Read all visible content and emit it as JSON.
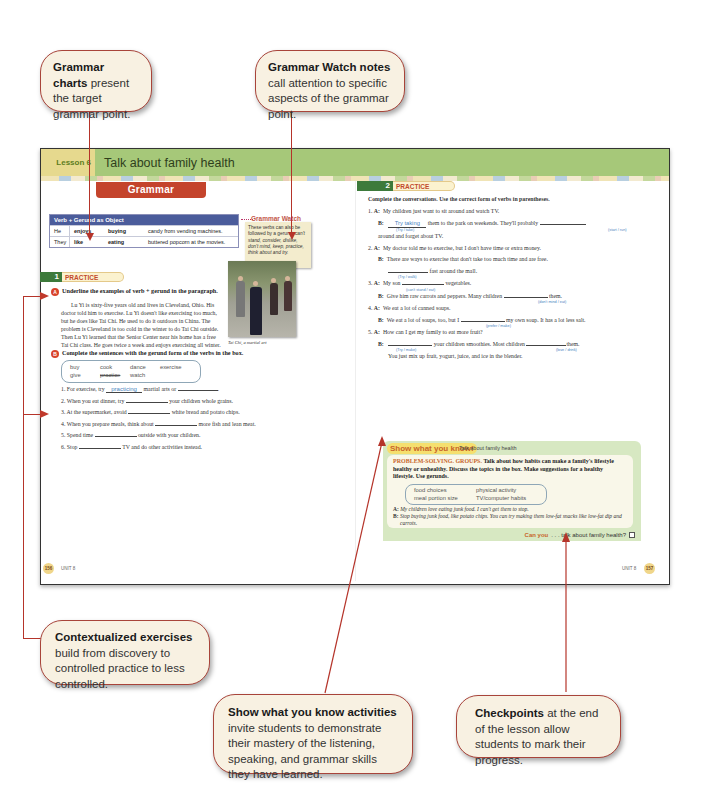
{
  "callouts": {
    "grammar_charts": {
      "bold": "Grammar charts",
      "text": " present the target grammar point."
    },
    "grammar_watch": {
      "bold": "Grammar Watch notes",
      "text": " call attention to specific aspects of the grammar point."
    },
    "contextualized": {
      "bold": "Contextualized exercises",
      "text": " build from discovery to controlled practice to less controlled."
    },
    "show_what": {
      "bold": "Show what you know activities",
      "text": " invite students to demonstrate their mastery of the listening, speaking, and grammar skills they have learned."
    },
    "checkpoints": {
      "bold": "Checkpoints",
      "text": " at the end of the lesson allow students to mark their progress."
    }
  },
  "lesson": {
    "tab": "Lesson 6",
    "title": "Talk about family health"
  },
  "grammar": {
    "banner": "Grammar",
    "table": {
      "header": "Verb + Gerund as Object",
      "rows": [
        {
          "subject": "He",
          "verb": "enjoys",
          "gerund": "buying",
          "object": "candy from vending machines."
        },
        {
          "subject": "They",
          "verb": "like",
          "gerund": "eating",
          "object": "buttered popcorn at the movies."
        }
      ]
    },
    "watch": {
      "title": "Grammar Watch",
      "text_plain": "These verbs can also be followed by a gerund:",
      "text_italic": "can't stand, consider, dislike, don't mind, keep, practice, think about and try."
    }
  },
  "practice1": {
    "num": "1",
    "label": "PRACTICE",
    "a": {
      "letter": "A",
      "instruction": "Underline the examples of verb + gerund in the paragraph.",
      "paragraph": "Lu Yi is sixty-five years old and lives in Cleveland, Ohio. His doctor told him to exercise. Lu Yi doesn't like exercising too much, but he does like Tai Chi. He used to do it outdoors in China. The problem is Cleveland is too cold in the winter to do Tai Chi outside. Then Lu Yi learned that the Senior Center near his home has a free Tai Chi class. He goes twice a week and enjoys exercising all winter.",
      "photo_caption": "Tai Chi, a martial art"
    },
    "b": {
      "letter": "B",
      "instruction": "Complete the sentences with the gerund form of the verbs in the box.",
      "words": [
        "buy",
        "cook",
        "dance",
        "exercise",
        "give",
        "practice",
        "watch"
      ],
      "crossed": "practice",
      "items": [
        {
          "n": "1.",
          "pre": "For exercise, try",
          "answer": "practicing",
          "post": "martial arts or",
          "post2": "."
        },
        {
          "n": "2.",
          "pre": "When you eat dinner, try",
          "answer": "",
          "post": "your children whole grains."
        },
        {
          "n": "3.",
          "pre": "At the supermarket, avoid",
          "answer": "",
          "post": "white bread and potato chips."
        },
        {
          "n": "4.",
          "pre": "When you prepare meals, think about",
          "answer": "",
          "post": "more fish and lean meat."
        },
        {
          "n": "5.",
          "pre": "Spend time",
          "answer": "",
          "post": "outside with your children."
        },
        {
          "n": "6.",
          "pre": "Stop",
          "answer": "",
          "post": "TV and do other activities instead."
        }
      ]
    },
    "page": "156",
    "unit": "UNIT 8"
  },
  "practice2": {
    "num": "2",
    "label": "PRACTICE",
    "instruction": "Complete the conversations. Use the correct form of verbs in parentheses.",
    "items": [
      {
        "n": "1.",
        "a": "My children just want to sit around and watch TV.",
        "b_answer": "Try taking",
        "b_hint": "(Try / take)",
        "b_mid": "them to the park on weekends. They'll probably",
        "b_hint2": "(start / run)",
        "b_end": "around and forget about TV."
      },
      {
        "n": "2.",
        "a": "My doctor told me to exercise, but I don't have time or extra money.",
        "b": "There are ways to exercise that don't take too much time and are free.",
        "b2_hint": "(Try / walk)",
        "b2_end": "fast around the mall."
      },
      {
        "n": "3.",
        "a_pre": "My son",
        "a_hint": "(can't stand / eat)",
        "a_post": "vegetables.",
        "b_pre": "Give him raw carrots and peppers. Many children",
        "b_hint": "(don't mind / eat)",
        "b_post": "them."
      },
      {
        "n": "4.",
        "a": "We eat a lot of canned soups.",
        "b_pre": "We eat a lot of soups, too, but I",
        "b_hint": "(prefer / make)",
        "b_post": "my own soup. It has a lot less salt."
      },
      {
        "n": "5.",
        "a": "How can I get my family to eat more fruit?",
        "b_hint": "(Try / make)",
        "b_mid": "your children smoothies. Most children",
        "b_hint2": "(love / drink)",
        "b_post": "them.",
        "b_end": "You just mix up fruit, yogurt, juice, and ice in the blender."
      }
    ],
    "page": "157",
    "unit": "UNIT 8"
  },
  "show_what_you_know": {
    "title": "Show what you know!",
    "subtitle": "Talk about family health",
    "lead": "PROBLEM-SOLVING. GROUPS.",
    "instruction": "Talk about how habits can make a family's lifestyle healthy or unhealthy. Discuss the topics in the box. Make suggestions for a healthy lifestyle. Use gerunds.",
    "topics": [
      "food choices",
      "physical activity",
      "meal portion size",
      "TV/computer habits"
    ],
    "dialog_a": "My children love eating junk food. I can't get them to stop.",
    "dialog_b": "Stop buying junk food, like potato chips. You can try making them low-fat snacks like low-fat dip and carrots.",
    "checkpoint_can": "Can you",
    "checkpoint_text": ". . . talk about family health?"
  },
  "labels": {
    "A": "A:",
    "B": "B:"
  }
}
